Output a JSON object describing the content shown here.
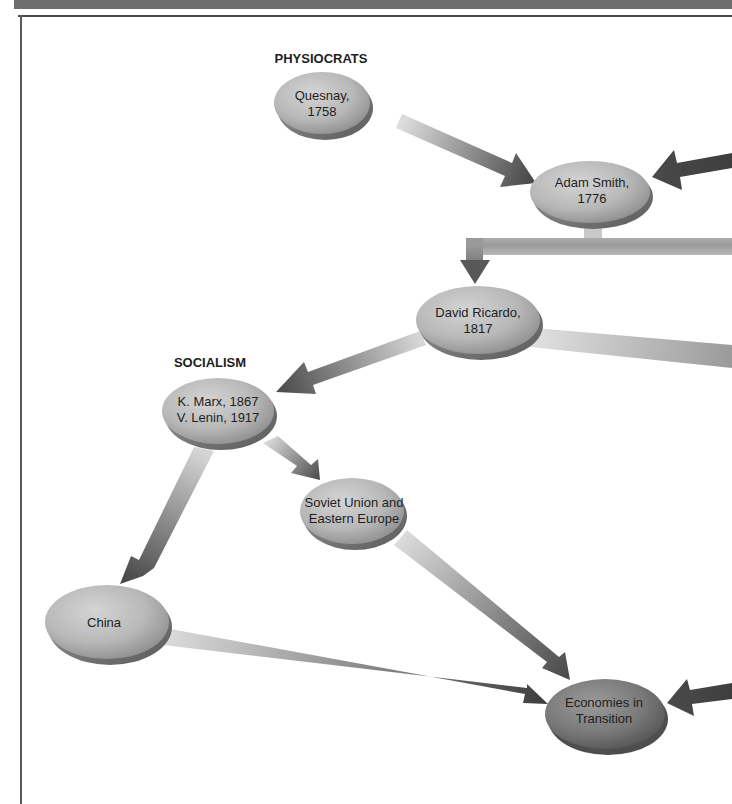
{
  "header": {
    "title": "",
    "bar_color": "#6e6e6e"
  },
  "sections": {
    "physiocrats": "PHYSIOCRATS",
    "socialism": "SOCIALISM"
  },
  "nodes": {
    "quesnay": {
      "line1": "Quesnay,",
      "line2": "1758"
    },
    "adam_smith": {
      "line1": "Adam Smith,",
      "line2": "1776"
    },
    "ricardo": {
      "line1": "David Ricardo,",
      "line2": "1817"
    },
    "marx_lenin": {
      "line1": "K. Marx, 1867",
      "line2": "V. Lenin, 1917"
    },
    "soviet": {
      "line1": "Soviet Union and",
      "line2": "Eastern Europe"
    },
    "china": {
      "line1": "China"
    },
    "transition": {
      "line1": "Economies in",
      "line2": "Transition"
    }
  },
  "edges": [
    {
      "from": "Quesnay, 1758",
      "to": "Adam Smith, 1776"
    },
    {
      "from": "(offscreen right)",
      "to": "Adam Smith, 1776"
    },
    {
      "from": "Adam Smith, 1776",
      "to": "David Ricardo, 1817"
    },
    {
      "from": "Adam Smith, 1776",
      "to": "(offscreen right)"
    },
    {
      "from": "David Ricardo, 1817",
      "to": "(offscreen right)"
    },
    {
      "from": "David Ricardo, 1817",
      "to": "K. Marx, 1867 / V. Lenin, 1917"
    },
    {
      "from": "K. Marx, 1867 / V. Lenin, 1917",
      "to": "Soviet Union and Eastern Europe"
    },
    {
      "from": "K. Marx, 1867 / V. Lenin, 1917",
      "to": "China"
    },
    {
      "from": "Soviet Union and Eastern Europe",
      "to": "Economies in Transition"
    },
    {
      "from": "China",
      "to": "Economies in Transition"
    },
    {
      "from": "(offscreen right)",
      "to": "Economies in Transition"
    }
  ],
  "colors": {
    "node_light": "#bdbdbd",
    "node_dark": "#7a7a7a",
    "arrow_light": "#d8d8d8",
    "arrow_dark": "#4a4a4a"
  }
}
